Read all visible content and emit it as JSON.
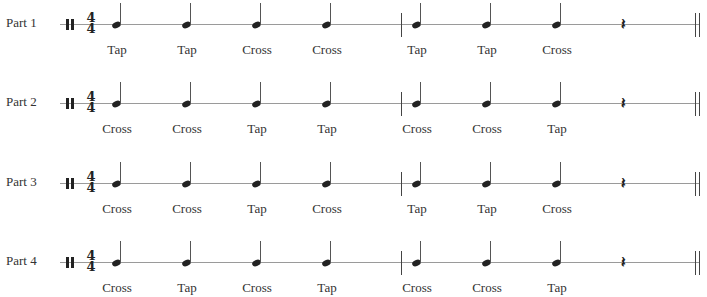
{
  "time_signature": {
    "top": "4",
    "bottom": "4"
  },
  "rest_glyph": "𝄽",
  "layout": {
    "note_x": [
      112,
      182,
      252,
      322,
      412,
      482,
      552
    ],
    "label_x": [
      117,
      187,
      257,
      327,
      417,
      487,
      557
    ],
    "barline_x": 401,
    "rest_x": 621,
    "final_bar_x": 695
  },
  "parts": [
    {
      "label": "Part 1",
      "staff_y": 24,
      "beats": [
        "Tap",
        "Tap",
        "Cross",
        "Cross",
        "Tap",
        "Tap",
        "Cross"
      ]
    },
    {
      "label": "Part 2",
      "staff_y": 103,
      "beats": [
        "Cross",
        "Cross",
        "Tap",
        "Tap",
        "Cross",
        "Cross",
        "Tap"
      ]
    },
    {
      "label": "Part 3",
      "staff_y": 183,
      "beats": [
        "Cross",
        "Cross",
        "Tap",
        "Cross",
        "Tap",
        "Tap",
        "Cross"
      ]
    },
    {
      "label": "Part 4",
      "staff_y": 262,
      "beats": [
        "Cross",
        "Tap",
        "Cross",
        "Tap",
        "Cross",
        "Cross",
        "Tap"
      ]
    }
  ]
}
